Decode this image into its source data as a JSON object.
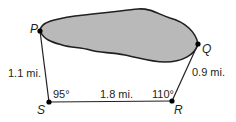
{
  "diagram": {
    "title": "",
    "colors": {
      "line": "#231f20",
      "lake_fill": "#b9b9b9",
      "background": "#ffffff"
    },
    "points": {
      "P": {
        "label": "P",
        "x": 40,
        "y": 31
      },
      "Q": {
        "label": "Q",
        "x": 198,
        "y": 44
      },
      "R": {
        "label": "R",
        "x": 172,
        "y": 101
      },
      "S": {
        "label": "S",
        "x": 49,
        "y": 102
      }
    },
    "segments": [
      {
        "from": "P",
        "to": "S",
        "label": "1.1 mi."
      },
      {
        "from": "S",
        "to": "R",
        "label": "1.8 mi."
      },
      {
        "from": "R",
        "to": "Q",
        "label": "0.9 mi."
      }
    ],
    "angles": [
      {
        "vertex": "S",
        "label": "95°"
      },
      {
        "vertex": "R",
        "label": "110°"
      }
    ],
    "region": {
      "name": "lake",
      "between": [
        "P",
        "Q"
      ],
      "shaded": true
    }
  }
}
